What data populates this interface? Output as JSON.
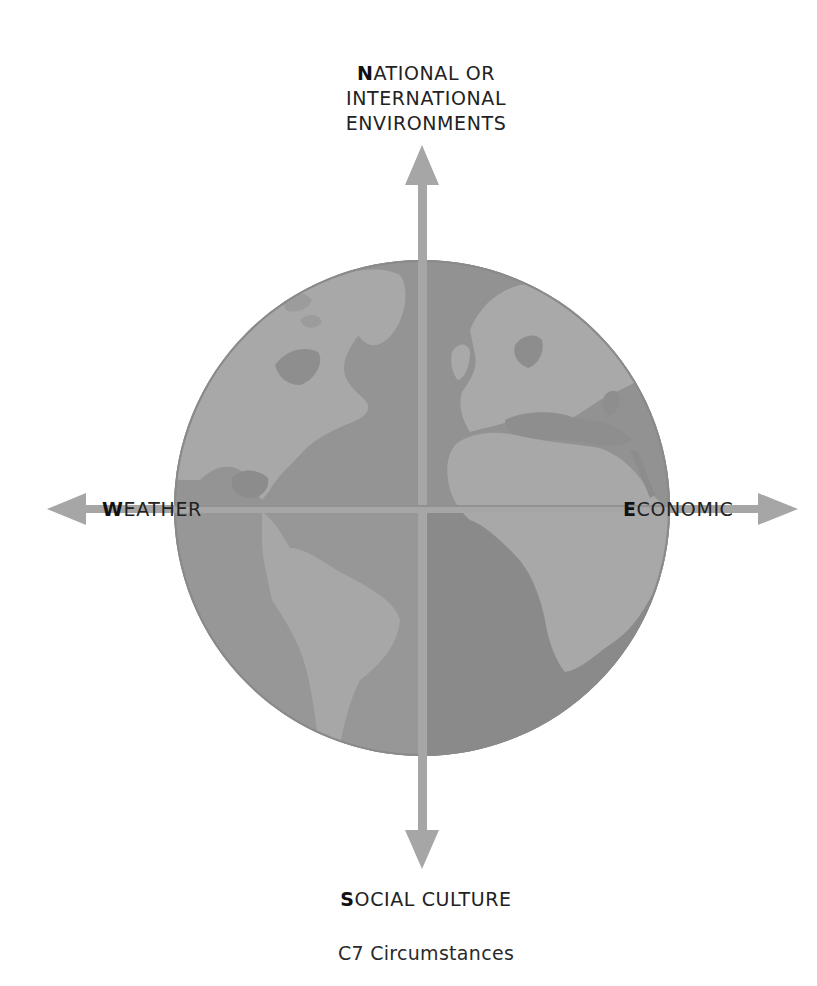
{
  "diagram": {
    "title": "C7 Circumstances",
    "center_image": "world-globe (Americas, Europe, Africa)",
    "axes": {
      "north": {
        "initial": "N",
        "lines": [
          "ATIONAL OR",
          "INTERNATIONAL",
          "ENVIRONMENTS"
        ]
      },
      "west": {
        "initial": "W",
        "rest": "EATHER"
      },
      "east": {
        "initial": "E",
        "rest": "CONOMIC"
      },
      "south": {
        "initial": "S",
        "rest": "OCIAL CULTURE"
      }
    },
    "colors": {
      "arrow": "#a6a6a6",
      "ocean": "#8e8e8e",
      "land": "#a9a9a9",
      "ocean_dark": "#868686",
      "text": "#222222"
    }
  }
}
